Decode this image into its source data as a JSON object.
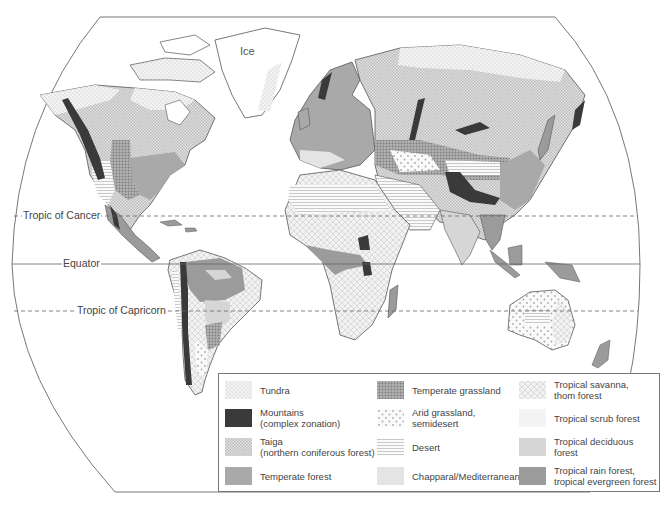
{
  "map": {
    "labels": {
      "ice": "Ice",
      "tropic_of_cancer": "Tropic of Cancer",
      "equator": "Equator",
      "tropic_of_capricorn": "Tropic of Capricorn"
    }
  },
  "legend": {
    "items": [
      {
        "label": "Tundra",
        "sublabel": "",
        "pattern": "tundra"
      },
      {
        "label": "Mountains",
        "sublabel": "(complex zonation)",
        "pattern": "mountains",
        "color": "#3a3a3a"
      },
      {
        "label": "Taiga",
        "sublabel": "(northern coniferous forest)",
        "pattern": "taiga"
      },
      {
        "label": "Temperate forest",
        "sublabel": "",
        "pattern": "temperate-forest",
        "color": "#a9a9a9"
      },
      {
        "label": "Temperate grassland",
        "sublabel": "",
        "pattern": "temperate-grassland"
      },
      {
        "label": "Arid grassland,",
        "sublabel": "semidesert",
        "pattern": "arid-grassland"
      },
      {
        "label": "Desert",
        "sublabel": "",
        "pattern": "desert"
      },
      {
        "label": "Chapparal/Mediterranean",
        "sublabel": "",
        "pattern": "chaparral",
        "color": "#e4e4e4"
      },
      {
        "label": "Tropical savanna,",
        "sublabel": "thom forest",
        "pattern": "savanna"
      },
      {
        "label": "Tropical scrub forest",
        "sublabel": "",
        "pattern": "scrub",
        "color": "#f4f4f4"
      },
      {
        "label": "Tropical deciduous forest",
        "sublabel": "",
        "pattern": "tropical-deciduous",
        "color": "#d6d6d6"
      },
      {
        "label": "Tropical rain forest,",
        "sublabel": "tropical evergreen forest",
        "pattern": "rainforest",
        "color": "#9b9b9b"
      }
    ]
  }
}
